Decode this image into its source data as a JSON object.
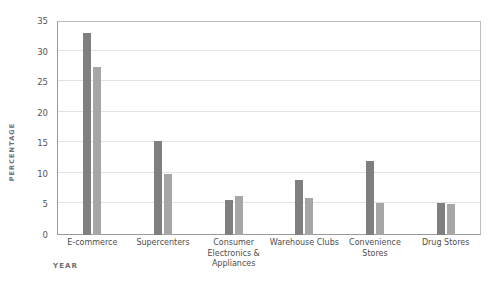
{
  "chart_data": {
    "type": "bar",
    "title": "",
    "subtitle": "",
    "xlabel": "YEAR",
    "ylabel": "PERCENTAGE",
    "categories": [
      "E-commerce",
      "Supercenters",
      "Consumer Electronics & Appliances",
      "Warehouse Clubs",
      "Convenience Stores",
      "Drug Stores"
    ],
    "series": [
      {
        "name": "series-1",
        "color": "#7f7f7f",
        "values": [
          33.0,
          15.4,
          5.8,
          9.0,
          12.1,
          5.3
        ]
      },
      {
        "name": "series-2",
        "color": "#a6a6a6",
        "values": [
          27.4,
          10.0,
          6.3,
          6.0,
          5.2,
          5.0
        ]
      }
    ],
    "ylim": [
      0,
      35
    ],
    "yticks": [
      0,
      5,
      10,
      15,
      20,
      25,
      30,
      35
    ],
    "ytick_labels": [
      "0",
      "5",
      "10",
      "15",
      "20",
      "25",
      "30",
      "35"
    ],
    "grid": true,
    "grid_axis": "y",
    "legend": false,
    "legend_position": "none",
    "annotations": [],
    "background_color": "#ffffff",
    "gridline_color": "#e2e2e2",
    "axis_color": "#9a9a9a",
    "tick_label_color": "#555555",
    "axis_title_color": "#6d6d6d"
  }
}
